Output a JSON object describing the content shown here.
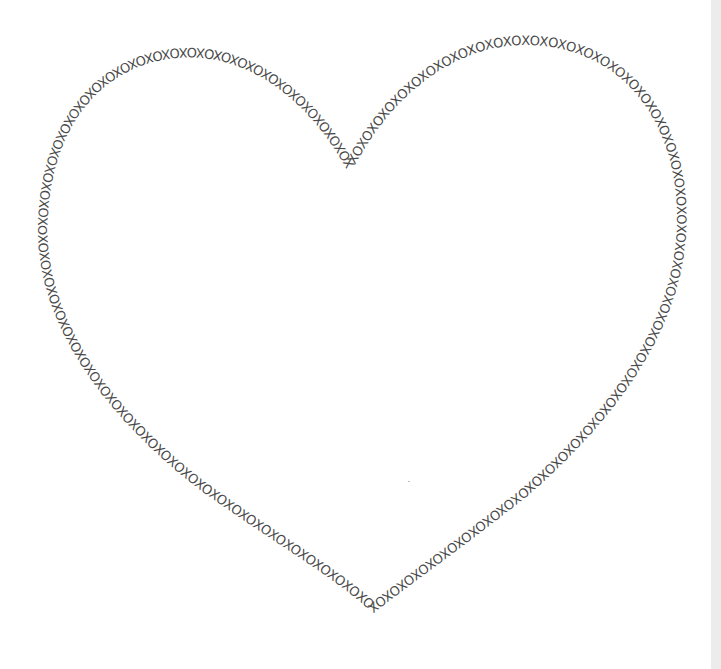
{
  "artwork": {
    "title": "XOXO heart outline",
    "repeat_text": "XOXOXOXOXOXOXOXOXOXOXOXOXOXOXOXOXOXOXOXOXOXOXOXOXOXOXOXOXOXOXOXOXOXOXOXOXOXOXOXOXOXOXOXOXOXOXOXOXOXOXOXOXOXOXOXOXOXOXOXOXOXOXOXOXOXOXOXOXOXOXOXOXOXOXOXOXOXOXOXOXOXOXOXOXOXOXOXOXOXOXOXOXOXOXOXOXOXOXOXOXOXOXOXOXOXOXOXO",
    "text_color": "#4a4a4a",
    "background_color": "#ffffff",
    "edge_color": "#ececec"
  }
}
